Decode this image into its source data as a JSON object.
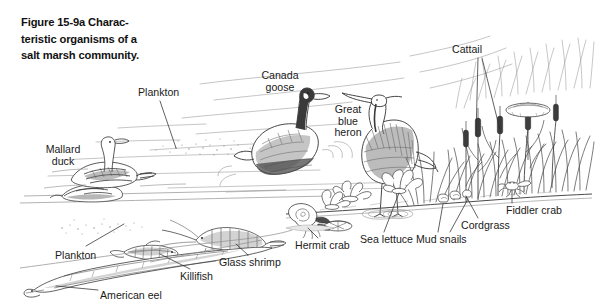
{
  "figure": {
    "caption": "Figure 15-9a  Characteristic organisms of a salt marsh community.",
    "caption_lines": [
      "Figure 15-9a  Charac-",
      "teristic organisms of a",
      "salt marsh community."
    ],
    "style": "black-and-white pen-and-ink line drawing",
    "background_color": "#ffffff",
    "ink_color": "#2b2b2b",
    "label_color": "#1a1a1a"
  },
  "labels": [
    {
      "id": "plankton-top",
      "text": "Plankton",
      "lines": [
        "Plankton"
      ],
      "x": 138,
      "y": 87,
      "align": "left"
    },
    {
      "id": "mallard-duck",
      "text": "Mallard duck",
      "lines": [
        "Mallard",
        "duck"
      ],
      "x": 28,
      "y": 144,
      "align": "center"
    },
    {
      "id": "canada-goose",
      "text": "Canada goose",
      "lines": [
        "Canada",
        "goose"
      ],
      "x": 250,
      "y": 70,
      "align": "center"
    },
    {
      "id": "great-blue-heron",
      "text": "Great blue heron",
      "lines": [
        "Great",
        "blue",
        "heron"
      ],
      "x": 327,
      "y": 104,
      "align": "center"
    },
    {
      "id": "cattail",
      "text": "Cattail",
      "lines": [
        "Cattail"
      ],
      "x": 452,
      "y": 44,
      "align": "left"
    },
    {
      "id": "fiddler-crab",
      "text": "Fiddler crab",
      "lines": [
        "Fiddler crab"
      ],
      "x": 506,
      "y": 205,
      "align": "left"
    },
    {
      "id": "cordgrass",
      "text": "Cordgrass",
      "lines": [
        "Cordgrass"
      ],
      "x": 461,
      "y": 220,
      "align": "left"
    },
    {
      "id": "mud-snails",
      "text": "Mud snails",
      "lines": [
        "Mud snails"
      ],
      "x": 416,
      "y": 234,
      "align": "left"
    },
    {
      "id": "sea-lettuce",
      "text": "Sea lettuce",
      "lines": [
        "Sea lettuce"
      ],
      "x": 360,
      "y": 234,
      "align": "left"
    },
    {
      "id": "hermit-crab",
      "text": "Hermit crab",
      "lines": [
        "Hermit crab"
      ],
      "x": 295,
      "y": 240,
      "align": "left"
    },
    {
      "id": "glass-shrimp",
      "text": "Glass shrimp",
      "lines": [
        "Glass shrimp"
      ],
      "x": 219,
      "y": 257,
      "align": "left"
    },
    {
      "id": "killifish",
      "text": "Killifish",
      "lines": [
        "Killifish"
      ],
      "x": 180,
      "y": 271,
      "align": "left"
    },
    {
      "id": "plankton-bottom",
      "text": "Plankton",
      "lines": [
        "Plankton"
      ],
      "x": 55,
      "y": 250,
      "align": "left"
    },
    {
      "id": "american-eel",
      "text": "American eel",
      "lines": [
        "American eel"
      ],
      "x": 100,
      "y": 290,
      "align": "left"
    }
  ],
  "organisms": [
    "Plankton",
    "Mallard duck",
    "Canada goose",
    "Great blue heron",
    "Cattail",
    "Fiddler crab",
    "Cordgrass",
    "Mud snails",
    "Sea lettuce",
    "Hermit crab",
    "Glass shrimp",
    "Killifish",
    "American eel"
  ]
}
